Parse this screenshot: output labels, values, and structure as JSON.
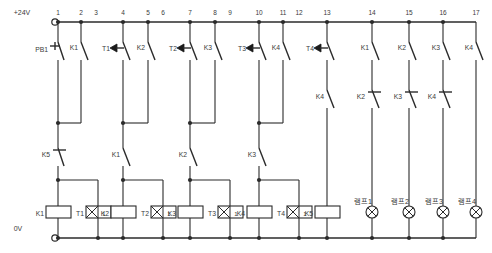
{
  "diagram": {
    "supply_top_label": "+24V",
    "supply_bottom_label": "0V",
    "rung_numbers": [
      "1",
      "2",
      "3",
      "4",
      "5",
      "6",
      "7",
      "8",
      "9",
      "10",
      "11",
      "12",
      "13",
      "14",
      "15",
      "16",
      "17"
    ],
    "colors": {
      "wire": "#2b2b2b",
      "background": "#ffffff",
      "text": "#3a3a3a"
    }
  },
  "contacts_top": [
    {
      "id": "c1",
      "label": "PB1",
      "type": "pushbutton-no",
      "rung": 1
    },
    {
      "id": "c2",
      "label": "K1",
      "type": "contact-no",
      "rung": 2
    },
    {
      "id": "c3",
      "label": "T1",
      "type": "timer-contact",
      "rung": 4
    },
    {
      "id": "c4",
      "label": "K2",
      "type": "contact-no",
      "rung": 5
    },
    {
      "id": "c5",
      "label": "T2",
      "type": "timer-contact",
      "rung": 7
    },
    {
      "id": "c6",
      "label": "K3",
      "type": "contact-no",
      "rung": 8
    },
    {
      "id": "c7",
      "label": "T3",
      "type": "timer-contact",
      "rung": 10
    },
    {
      "id": "c8",
      "label": "K4",
      "type": "contact-no",
      "rung": 11
    },
    {
      "id": "c9",
      "label": "T4",
      "type": "timer-contact",
      "rung": 13
    },
    {
      "id": "c10",
      "label": "K1",
      "type": "contact-no",
      "rung": 14
    },
    {
      "id": "c11",
      "label": "K2",
      "type": "contact-no",
      "rung": 15
    },
    {
      "id": "c12",
      "label": "K3",
      "type": "contact-no",
      "rung": 16
    },
    {
      "id": "c13",
      "label": "K4",
      "type": "contact-no",
      "rung": 17
    }
  ],
  "contacts_mid": [
    {
      "id": "m1",
      "label": "K4",
      "type": "contact-no",
      "rung": 13
    },
    {
      "id": "m2",
      "label": "K2",
      "type": "contact-nc",
      "rung": 14
    },
    {
      "id": "m3",
      "label": "K3",
      "type": "contact-nc",
      "rung": 15
    },
    {
      "id": "m4",
      "label": "K4",
      "type": "contact-nc",
      "rung": 16
    }
  ],
  "contacts_lower": [
    {
      "id": "l1",
      "label": "K5",
      "type": "contact-nc",
      "rung": 1
    },
    {
      "id": "l2",
      "label": "K1",
      "type": "contact-no",
      "rung": 4
    },
    {
      "id": "l3",
      "label": "K2",
      "type": "contact-no",
      "rung": 7
    },
    {
      "id": "l4",
      "label": "K3",
      "type": "contact-no",
      "rung": 10
    }
  ],
  "coils": [
    {
      "id": "k1",
      "label": "K1",
      "type": "relay-coil",
      "rung": 1
    },
    {
      "id": "t1",
      "label": "T1",
      "type": "timer-coil",
      "rung": 2,
      "setting": "1"
    },
    {
      "id": "k2",
      "label": "K2",
      "type": "relay-coil",
      "rung": 4
    },
    {
      "id": "t2",
      "label": "T2",
      "type": "timer-coil",
      "rung": 5,
      "setting": "1"
    },
    {
      "id": "k3",
      "label": "K3",
      "type": "relay-coil",
      "rung": 7
    },
    {
      "id": "t3",
      "label": "T3",
      "type": "timer-coil",
      "rung": 8,
      "setting": "1"
    },
    {
      "id": "k4",
      "label": "K4",
      "type": "relay-coil",
      "rung": 10
    },
    {
      "id": "t4",
      "label": "T4",
      "type": "timer-coil",
      "rung": 11,
      "setting": "1"
    },
    {
      "id": "k5",
      "label": "K5",
      "type": "relay-coil",
      "rung": 13
    }
  ],
  "lamps": [
    {
      "id": "lamp1",
      "label": "램프1",
      "rung": 14
    },
    {
      "id": "lamp2",
      "label": "램프2",
      "rung": 15
    },
    {
      "id": "lamp3",
      "label": "램프3",
      "rung": 16
    },
    {
      "id": "lamp4",
      "label": "램프4",
      "rung": 17
    }
  ]
}
